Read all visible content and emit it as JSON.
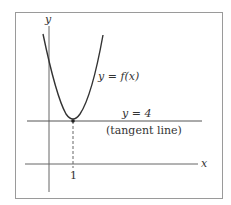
{
  "diagram": {
    "frame": {
      "x": 15,
      "y": 12,
      "width": 207,
      "height": 186,
      "stroke": "#9a9a9a"
    },
    "axes": {
      "y_label": "y",
      "x_label": "x"
    },
    "curve": {
      "label": "y = f(x)",
      "label_lhs": "y",
      "label_eq": " = ",
      "label_rhs": "f(x)",
      "color": "#333333"
    },
    "tangent": {
      "equation": "y = 4",
      "annotation": "(tangent line)"
    },
    "tick": {
      "x_value": "1"
    },
    "colors": {
      "line": "#444444",
      "axis": "#666666",
      "text": "#333333",
      "background": "#ffffff"
    }
  }
}
